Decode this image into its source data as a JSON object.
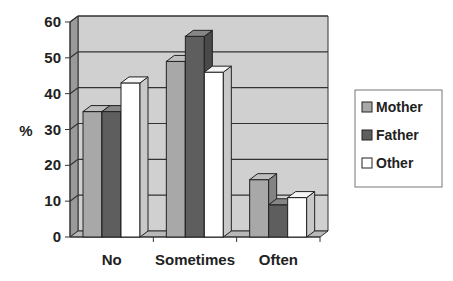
{
  "chart_data": {
    "type": "bar",
    "title": "",
    "xlabel": "",
    "ylabel": "%",
    "ylim": [
      0,
      60
    ],
    "yticks": [
      0,
      10,
      20,
      30,
      40,
      50,
      60
    ],
    "grid": true,
    "legend_position": "right",
    "style": "3d-clustered",
    "categories": [
      "No",
      "Sometimes",
      "Often"
    ],
    "series": [
      {
        "name": "Mother",
        "color": "#a8a8a8",
        "values": [
          35,
          49,
          16
        ]
      },
      {
        "name": "Father",
        "color": "#5e5e5e",
        "values": [
          35,
          56,
          9
        ]
      },
      {
        "name": "Other",
        "color": "#ffffff",
        "values": [
          43,
          46,
          11
        ]
      }
    ]
  }
}
